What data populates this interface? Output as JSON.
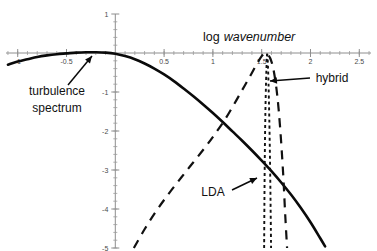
{
  "chart_data": {
    "type": "line",
    "title_parts": {
      "regular": "log",
      "italic": "wavenumber"
    },
    "xlabel": "log wavenumber",
    "ylabel": "",
    "xlim": [
      -1.12,
      2.62
    ],
    "ylim": [
      -5.0,
      1.0
    ],
    "grid": false,
    "legend": "none",
    "x_ticks": [
      -1,
      -0.5,
      0,
      0.5,
      1,
      1.5,
      2,
      2.5
    ],
    "x_tick_labels": [
      "-1",
      "-0.5",
      "",
      "0.5",
      "1",
      "1.5",
      "2",
      "2.5"
    ],
    "x_minor_tick_step": 0.1,
    "y_ticks": [
      1,
      0,
      -1,
      -2,
      -3,
      -4,
      -5
    ],
    "y_tick_labels": [
      "1",
      "",
      "-1",
      "-2",
      "-3",
      "-4",
      "-5"
    ],
    "y_minor_tick_step": 0.2,
    "series": [
      {
        "name": "turbulence spectrum",
        "style": "solid",
        "color": "#0a0a0a",
        "x": [
          -1.1,
          -1.0,
          -0.9,
          -0.8,
          -0.7,
          -0.6,
          -0.5,
          -0.4,
          -0.3,
          -0.2,
          -0.1,
          0.0,
          0.1,
          0.2,
          0.3,
          0.4,
          0.5,
          0.6,
          0.7,
          0.8,
          0.9,
          1.0,
          1.1,
          1.2,
          1.3,
          1.4,
          1.5,
          1.6,
          1.7,
          1.8,
          1.9,
          2.0,
          2.1,
          2.15
        ],
        "y": [
          -0.3,
          -0.22,
          -0.16,
          -0.1,
          -0.06,
          -0.03,
          -0.01,
          0.01,
          0.02,
          0.02,
          0.01,
          -0.02,
          -0.08,
          -0.16,
          -0.27,
          -0.4,
          -0.55,
          -0.72,
          -0.91,
          -1.11,
          -1.32,
          -1.54,
          -1.77,
          -2.01,
          -2.25,
          -2.5,
          -2.76,
          -3.03,
          -3.32,
          -3.63,
          -3.97,
          -4.34,
          -4.75,
          -4.96
        ]
      },
      {
        "name": "hybrid",
        "style": "dashed",
        "color": "#111111",
        "x": [
          0.19,
          0.3,
          0.42,
          0.55,
          0.68,
          0.8,
          0.92,
          1.02,
          1.12,
          1.22,
          1.3,
          1.38,
          1.45,
          1.5,
          1.53,
          1.57,
          1.6,
          1.63,
          1.66,
          1.69,
          1.72,
          1.74,
          1.76
        ],
        "y": [
          -5.0,
          -4.52,
          -4.05,
          -3.6,
          -3.18,
          -2.8,
          -2.42,
          -2.08,
          -1.72,
          -1.3,
          -0.95,
          -0.6,
          -0.28,
          -0.08,
          -0.01,
          -0.06,
          -0.22,
          -0.55,
          -1.1,
          -1.95,
          -3.1,
          -4.1,
          -5.0
        ]
      },
      {
        "name": "LDA",
        "style": "dotted",
        "color": "#111111",
        "description": "narrow near-vertical spike",
        "x_left": [
          1.525,
          1.528,
          1.532,
          1.538,
          1.545,
          1.552,
          1.556
        ],
        "y_left": [
          -5.0,
          -3.8,
          -2.6,
          -1.5,
          -0.7,
          -0.18,
          -0.02
        ],
        "x_right": [
          1.556,
          1.562,
          1.57,
          1.578,
          1.586,
          1.592,
          1.596
        ],
        "y_right": [
          -0.02,
          -0.2,
          -0.8,
          -1.7,
          -2.9,
          -4.1,
          -5.0
        ]
      }
    ],
    "annotations": [
      {
        "name": "turbulence-spectrum",
        "text_lines": [
          "turbulence",
          "spectrum"
        ],
        "text_x": 57,
        "text_y": 95,
        "points_to_x": 92,
        "points_to_y": 56
      },
      {
        "name": "hybrid",
        "text_lines": [
          "hybrid"
        ],
        "text_x": 332,
        "text_y": 82,
        "points_to_x": 270,
        "points_to_y": 81
      },
      {
        "name": "LDA",
        "text_lines": [
          "LDA"
        ],
        "text_x": 213,
        "text_y": 196,
        "points_to_x": 257,
        "points_to_y": 178
      }
    ]
  },
  "figure": {
    "caption": "",
    "background_color": "#ffffff"
  }
}
